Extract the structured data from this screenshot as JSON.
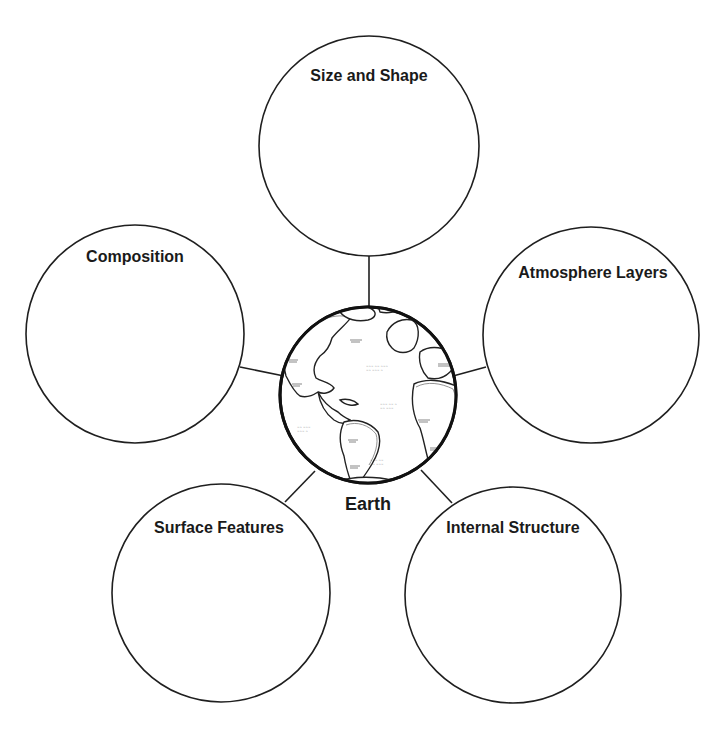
{
  "diagram": {
    "type": "concept-web",
    "center": {
      "label": "Earth",
      "icon": "globe-icon",
      "cx": 368,
      "cy": 395,
      "r": 88
    },
    "nodes": [
      {
        "id": "size-and-shape",
        "label": "Size and Shape",
        "cx": 369,
        "cy": 146,
        "r": 110
      },
      {
        "id": "composition",
        "label": "Composition",
        "cx": 135,
        "cy": 334,
        "r": 109
      },
      {
        "id": "atmosphere-layers",
        "label": "Atmosphere Layers",
        "cx": 591,
        "cy": 335,
        "r": 108
      },
      {
        "id": "surface-features",
        "label": "Surface Features",
        "cx": 221,
        "cy": 593,
        "r": 109
      },
      {
        "id": "internal-structure",
        "label": "Internal Structure",
        "cx": 513,
        "cy": 595,
        "r": 108
      }
    ],
    "colors": {
      "stroke": "#1f1f1f",
      "text": "#1a1a1a",
      "background": "#ffffff"
    }
  }
}
